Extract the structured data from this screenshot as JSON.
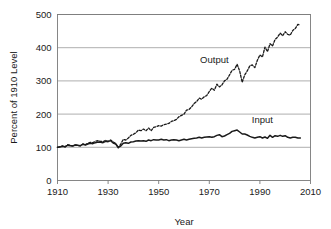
{
  "chart_data": {
    "type": "line",
    "title": "",
    "subtitle": "",
    "xlabel": "Year",
    "ylabel": "Percent of 1910 Level",
    "xlim": [
      1910,
      2010
    ],
    "ylim": [
      0,
      500
    ],
    "xticks": [
      1910,
      1930,
      1950,
      1970,
      1990,
      2010
    ],
    "yticks": [
      0,
      100,
      200,
      300,
      400,
      500
    ],
    "xtick_labels": [
      "1910",
      "1930",
      "1950",
      "1970",
      "1990",
      "2010"
    ],
    "ytick_labels": [
      "0",
      "100",
      "200",
      "300",
      "400",
      "500"
    ],
    "grid": "horizontal",
    "legend": "inline-annotations",
    "colors": {
      "axis": "#7a7a7a",
      "grid": "#9a9a9a",
      "output_line": "#1a1a1a",
      "input_line": "#1a1a1a",
      "text": "#1a1a1a",
      "background": "#ffffff"
    },
    "annotations": [
      {
        "text": "Output",
        "x": 1972,
        "y": 355,
        "series": "Output"
      },
      {
        "text": "Input",
        "x": 1991,
        "y": 172,
        "series": "Input"
      }
    ],
    "series": [
      {
        "name": "Output",
        "style": "dashed",
        "x": [
          1910,
          1911,
          1912,
          1913,
          1914,
          1915,
          1916,
          1917,
          1918,
          1919,
          1920,
          1921,
          1922,
          1923,
          1924,
          1925,
          1926,
          1927,
          1928,
          1929,
          1930,
          1931,
          1932,
          1933,
          1934,
          1935,
          1936,
          1937,
          1938,
          1939,
          1940,
          1941,
          1942,
          1943,
          1944,
          1945,
          1946,
          1947,
          1948,
          1949,
          1950,
          1951,
          1952,
          1953,
          1954,
          1955,
          1956,
          1957,
          1958,
          1959,
          1960,
          1961,
          1962,
          1963,
          1964,
          1965,
          1966,
          1967,
          1968,
          1969,
          1970,
          1971,
          1972,
          1973,
          1974,
          1975,
          1976,
          1977,
          1978,
          1979,
          1980,
          1981,
          1982,
          1983,
          1984,
          1985,
          1986,
          1987,
          1988,
          1989,
          1990,
          1991,
          1992,
          1993,
          1994,
          1995,
          1996,
          1997,
          1998,
          1999,
          2000,
          2001,
          2002,
          2003,
          2004,
          2005,
          2006
        ],
        "values": [
          100,
          102,
          104,
          101,
          108,
          106,
          104,
          107,
          106,
          104,
          110,
          108,
          112,
          115,
          114,
          118,
          120,
          118,
          117,
          121,
          118,
          122,
          116,
          112,
          98,
          110,
          124,
          122,
          128,
          136,
          139,
          144,
          152,
          150,
          155,
          150,
          158,
          150,
          160,
          162,
          165,
          164,
          168,
          170,
          172,
          178,
          180,
          184,
          192,
          196,
          200,
          212,
          214,
          222,
          232,
          238,
          248,
          245,
          252,
          256,
          268,
          278,
          272,
          290,
          282,
          288,
          300,
          305,
          318,
          332,
          335,
          350,
          330,
          296,
          318,
          330,
          345,
          348,
          340,
          362,
          378,
          372,
          402,
          388,
          412,
          405,
          425,
          432,
          444,
          436,
          448,
          440,
          438,
          452,
          458,
          470,
          468
        ]
      },
      {
        "name": "Input",
        "style": "solid",
        "x": [
          1910,
          1911,
          1912,
          1913,
          1914,
          1915,
          1916,
          1917,
          1918,
          1919,
          1920,
          1921,
          1922,
          1923,
          1924,
          1925,
          1926,
          1927,
          1928,
          1929,
          1930,
          1931,
          1932,
          1933,
          1934,
          1935,
          1936,
          1937,
          1938,
          1939,
          1940,
          1941,
          1942,
          1943,
          1944,
          1945,
          1946,
          1947,
          1948,
          1949,
          1950,
          1951,
          1952,
          1953,
          1954,
          1955,
          1956,
          1957,
          1958,
          1959,
          1960,
          1961,
          1962,
          1963,
          1964,
          1965,
          1966,
          1967,
          1968,
          1969,
          1970,
          1971,
          1972,
          1973,
          1974,
          1975,
          1976,
          1977,
          1978,
          1979,
          1980,
          1981,
          1982,
          1983,
          1984,
          1985,
          1986,
          1987,
          1988,
          1989,
          1990,
          1991,
          1992,
          1993,
          1994,
          1995,
          1996,
          1997,
          1998,
          1999,
          2000,
          2001,
          2002,
          2003,
          2004,
          2005,
          2006
        ],
        "values": [
          100,
          101,
          103,
          102,
          106,
          105,
          104,
          107,
          106,
          105,
          109,
          107,
          110,
          112,
          111,
          114,
          116,
          115,
          114,
          118,
          117,
          120,
          113,
          110,
          100,
          104,
          112,
          114,
          112,
          116,
          117,
          119,
          120,
          119,
          120,
          118,
          122,
          120,
          123,
          122,
          122,
          124,
          122,
          123,
          120,
          122,
          123,
          122,
          120,
          122,
          124,
          122,
          124,
          126,
          127,
          128,
          130,
          128,
          130,
          131,
          132,
          130,
          132,
          136,
          138,
          132,
          134,
          138,
          142,
          148,
          150,
          152,
          146,
          140,
          140,
          137,
          133,
          130,
          128,
          130,
          132,
          128,
          131,
          127,
          136,
          130,
          135,
          133,
          136,
          133,
          135,
          130,
          128,
          130,
          130,
          128,
          128
        ]
      }
    ]
  },
  "axes": {
    "ylabel": "Percent of 1910 Level",
    "xlabel": "Year"
  }
}
